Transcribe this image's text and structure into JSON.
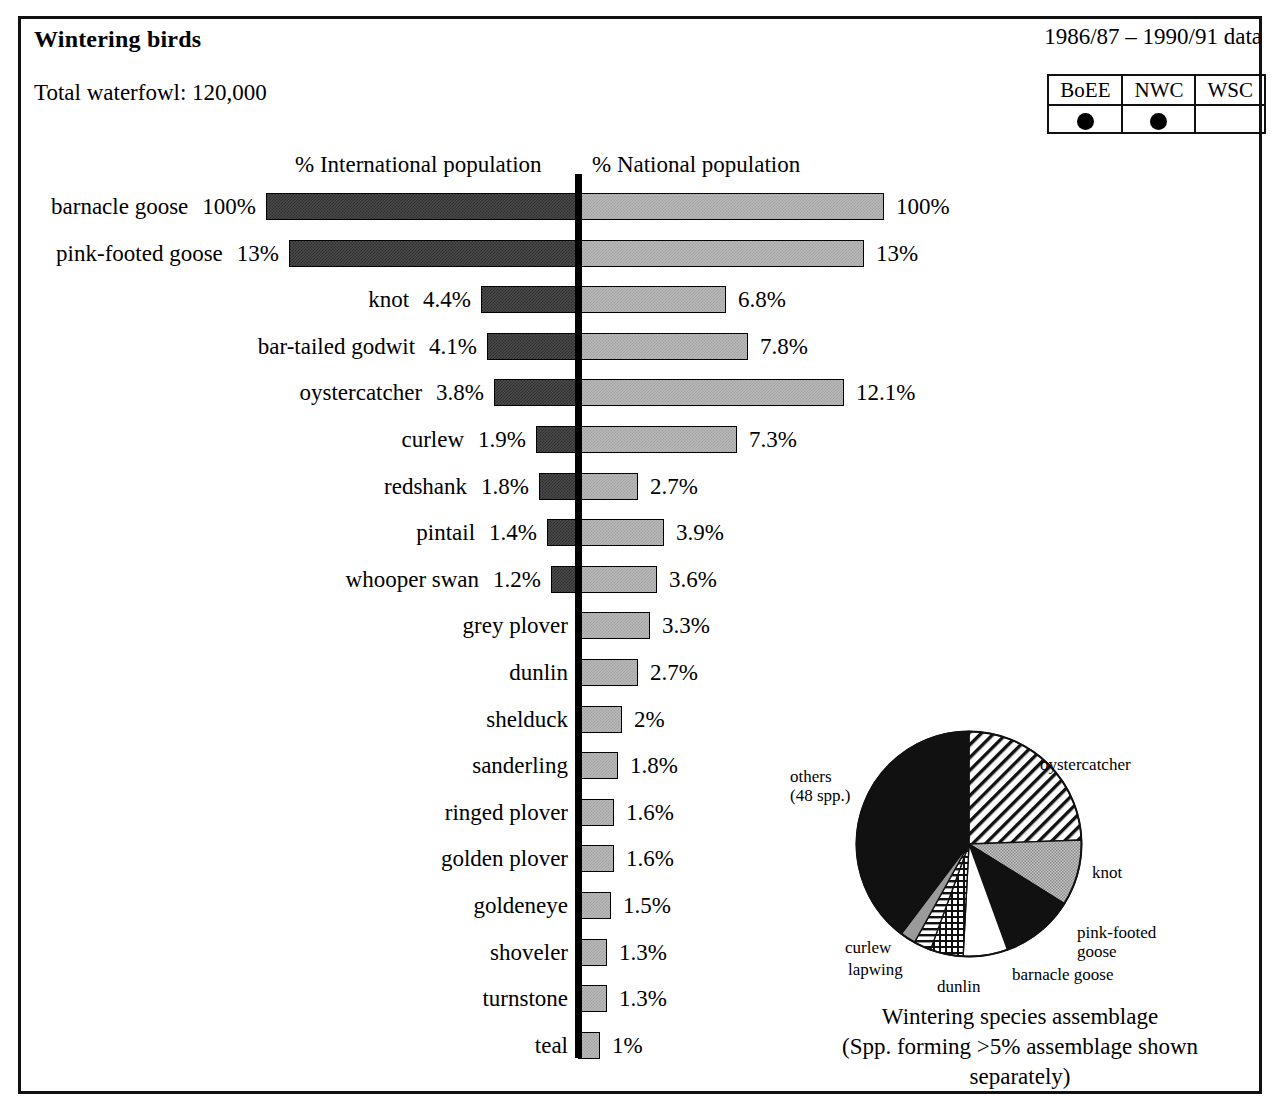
{
  "header": {
    "title": "Wintering birds",
    "total_waterfowl": "Total waterfowl: 120,000",
    "data_period": "1986/87 – 1990/91 data"
  },
  "survey_legend": {
    "columns": [
      "BoEE",
      "NWC",
      "WSC"
    ],
    "marks": [
      "dot",
      "dot",
      ""
    ],
    "dot_color": "#000000"
  },
  "axis_captions": {
    "international": "% International population",
    "national": "% National population"
  },
  "chart_data": {
    "type": "bar",
    "title": "Wintering birds",
    "subtitle": "Total waterfowl: 120,000",
    "orientation": "horizontal-diverging",
    "grid": false,
    "legend_position": "top-right",
    "categories": [
      "barnacle goose",
      "pink-footed goose",
      "knot",
      "bar-tailed godwit",
      "oystercatcher",
      "curlew",
      "redshank",
      "pintail",
      "whooper swan",
      "grey plover",
      "dunlin",
      "shelduck",
      "sanderling",
      "ringed plover",
      "golden plover",
      "goldeneye",
      "shoveler",
      "turnstone",
      "teal"
    ],
    "series": [
      {
        "name": "% International population",
        "side": "left",
        "color": "#3a3a3a",
        "values": [
          100,
          13,
          4.4,
          4.1,
          3.8,
          1.9,
          1.8,
          1.4,
          1.2,
          null,
          null,
          null,
          null,
          null,
          null,
          null,
          null,
          null,
          null
        ],
        "labels": [
          "100%",
          "13%",
          "4.4%",
          "4.1%",
          "3.8%",
          "1.9%",
          "1.8%",
          "1.4%",
          "1.2%",
          "",
          "",
          "",
          "",
          "",
          "",
          "",
          "",
          "",
          ""
        ]
      },
      {
        "name": "% National population",
        "side": "right",
        "color": "#b9b9b9",
        "values": [
          100,
          13,
          6.8,
          7.8,
          12.1,
          7.3,
          2.7,
          3.9,
          3.6,
          3.3,
          2.7,
          2,
          1.8,
          1.6,
          1.6,
          1.5,
          1.3,
          1.3,
          1
        ],
        "labels": [
          "100%",
          "13%",
          "6.8%",
          "7.8%",
          "12.1%",
          "7.3%",
          "2.7%",
          "3.9%",
          "3.6%",
          "3.3%",
          "2.7%",
          "2%",
          "1.8%",
          "1.6%",
          "1.6%",
          "1.5%",
          "1.3%",
          "1.3%",
          "1%"
        ]
      }
    ],
    "rows": [
      {
        "species": "barnacle goose",
        "intl": 100,
        "intl_label": "100%",
        "natl": 100,
        "natl_label": "100%",
        "left_px": 312,
        "right_px": 306
      },
      {
        "species": "pink-footed goose",
        "intl": 13,
        "intl_label": "13%",
        "natl": 13,
        "natl_label": "13%",
        "left_px": 289,
        "right_px": 286
      },
      {
        "species": "knot",
        "intl": 4.4,
        "intl_label": "4.4%",
        "natl": 6.8,
        "natl_label": "6.8%",
        "left_px": 97,
        "right_px": 148
      },
      {
        "species": "bar-tailed godwit",
        "intl": 4.1,
        "intl_label": "4.1%",
        "natl": 7.8,
        "natl_label": "7.8%",
        "left_px": 91,
        "right_px": 170
      },
      {
        "species": "oystercatcher",
        "intl": 3.8,
        "intl_label": "3.8%",
        "natl": 12.1,
        "natl_label": "12.1%",
        "left_px": 84,
        "right_px": 266
      },
      {
        "species": "curlew",
        "intl": 1.9,
        "intl_label": "1.9%",
        "natl": 7.3,
        "natl_label": "7.3%",
        "left_px": 42,
        "right_px": 159
      },
      {
        "species": "redshank",
        "intl": 1.8,
        "intl_label": "1.8%",
        "natl": 2.7,
        "natl_label": "2.7%",
        "left_px": 39,
        "right_px": 60
      },
      {
        "species": "pintail",
        "intl": 1.4,
        "intl_label": "1.4%",
        "natl": 3.9,
        "natl_label": "3.9%",
        "left_px": 31,
        "right_px": 86
      },
      {
        "species": "whooper swan",
        "intl": 1.2,
        "intl_label": "1.2%",
        "natl": 3.6,
        "natl_label": "3.6%",
        "left_px": 27,
        "right_px": 79
      },
      {
        "species": "grey plover",
        "intl": null,
        "intl_label": "",
        "natl": 3.3,
        "natl_label": "3.3%",
        "left_px": 0,
        "right_px": 72
      },
      {
        "species": "dunlin",
        "intl": null,
        "intl_label": "",
        "natl": 2.7,
        "natl_label": "2.7%",
        "left_px": 0,
        "right_px": 60
      },
      {
        "species": "shelduck",
        "intl": null,
        "intl_label": "",
        "natl": 2,
        "natl_label": "2%",
        "left_px": 0,
        "right_px": 44
      },
      {
        "species": "sanderling",
        "intl": null,
        "intl_label": "",
        "natl": 1.8,
        "natl_label": "1.8%",
        "left_px": 0,
        "right_px": 40
      },
      {
        "species": "ringed plover",
        "intl": null,
        "intl_label": "",
        "natl": 1.6,
        "natl_label": "1.6%",
        "left_px": 0,
        "right_px": 36
      },
      {
        "species": "golden plover",
        "intl": null,
        "intl_label": "",
        "natl": 1.6,
        "natl_label": "1.6%",
        "left_px": 0,
        "right_px": 36
      },
      {
        "species": "goldeneye",
        "intl": null,
        "intl_label": "",
        "natl": 1.5,
        "natl_label": "1.5%",
        "left_px": 0,
        "right_px": 33
      },
      {
        "species": "shoveler",
        "intl": null,
        "intl_label": "",
        "natl": 1.3,
        "natl_label": "1.3%",
        "left_px": 0,
        "right_px": 29
      },
      {
        "species": "turnstone",
        "intl": null,
        "intl_label": "",
        "natl": 1.3,
        "natl_label": "1.3%",
        "left_px": 0,
        "right_px": 29
      },
      {
        "species": "teal",
        "intl": null,
        "intl_label": "",
        "natl": 1,
        "natl_label": "1%",
        "left_px": 0,
        "right_px": 22
      }
    ],
    "pie": {
      "type": "pie",
      "title": "Wintering species assemblage",
      "subtitle": "(Spp. forming >5% assemblage shown separately)",
      "slices": [
        {
          "label": "oystercatcher",
          "start_deg": 0,
          "end_deg": 88,
          "fill": "diagonal-hatch"
        },
        {
          "label": "knot",
          "start_deg": 88,
          "end_deg": 122,
          "fill": "grey-dots"
        },
        {
          "label": "pink-footed goose",
          "start_deg": 122,
          "end_deg": 160,
          "fill": "black"
        },
        {
          "label": "barnacle goose",
          "start_deg": 160,
          "end_deg": 183,
          "fill": "white"
        },
        {
          "label": "dunlin",
          "start_deg": 183,
          "end_deg": 200,
          "fill": "cross-hatch"
        },
        {
          "label": "lapwing",
          "start_deg": 200,
          "end_deg": 209,
          "fill": "horizontal-lines"
        },
        {
          "label": "curlew",
          "start_deg": 209,
          "end_deg": 217,
          "fill": "grey"
        },
        {
          "label": "others (48 spp.)",
          "start_deg": 217,
          "end_deg": 360,
          "fill": "black"
        }
      ]
    }
  },
  "pie_labels": {
    "oystercatcher": "oystercatcher",
    "knot": "knot",
    "pink_footed_goose_line1": "pink-footed",
    "pink_footed_goose_line2": "goose",
    "barnacle_goose": "barnacle goose",
    "dunlin": "dunlin",
    "lapwing": "lapwing",
    "curlew": "curlew",
    "others_line1": "others",
    "others_line2": "(48 spp.)"
  },
  "pie_caption": {
    "title": "Wintering species assemblage",
    "subtitle": "(Spp. forming >5% assemblage shown separately)"
  }
}
